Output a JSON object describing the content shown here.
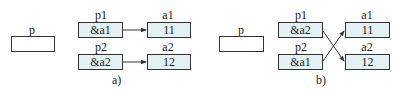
{
  "panels": [
    {
      "caption": "a)",
      "p": {
        "label": "p",
        "value": ""
      },
      "pointers": [
        {
          "label": "p1",
          "value": "&a1"
        },
        {
          "label": "p2",
          "value": "&a2"
        }
      ],
      "targets": [
        {
          "label": "a1",
          "value": "11"
        },
        {
          "label": "a2",
          "value": "12"
        }
      ],
      "arrows": [
        [
          "p1",
          "a1"
        ],
        [
          "p2",
          "a2"
        ]
      ]
    },
    {
      "caption": "b)",
      "p": {
        "label": "p",
        "value": ""
      },
      "pointers": [
        {
          "label": "p1",
          "value": "&a2"
        },
        {
          "label": "p2",
          "value": "&a1"
        }
      ],
      "targets": [
        {
          "label": "a1",
          "value": "11"
        },
        {
          "label": "a2",
          "value": "12"
        }
      ],
      "arrows": [
        [
          "p1",
          "a2"
        ],
        [
          "p2",
          "a1"
        ]
      ]
    }
  ],
  "colors": {
    "box_fill": "#e3f1f4",
    "border": "#333333"
  }
}
